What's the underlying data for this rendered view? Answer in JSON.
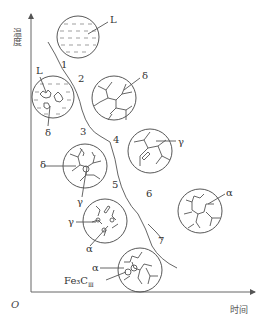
{
  "diagram": {
    "axes": {
      "y_label": "温度",
      "x_label": "时间",
      "origin": "O"
    },
    "stages": [
      "1",
      "2",
      "3",
      "4",
      "5",
      "6",
      "7"
    ],
    "phases": {
      "liquid": "L",
      "delta": "δ",
      "gamma": "γ",
      "alpha": "α",
      "cementite": "Fe₃C",
      "cementite_sub": "Ⅲ"
    },
    "circles": [
      {
        "id": "c1",
        "label": "L"
      },
      {
        "id": "c2",
        "labels": [
          "L",
          "δ"
        ]
      },
      {
        "id": "c3",
        "label": "δ"
      },
      {
        "id": "c4",
        "labels": [
          "δ",
          "γ"
        ]
      },
      {
        "id": "c5",
        "label": "γ"
      },
      {
        "id": "c6",
        "labels": [
          "γ",
          "α"
        ]
      },
      {
        "id": "c7",
        "label": "α"
      },
      {
        "id": "c8",
        "labels": [
          "α",
          "Fe₃CⅢ"
        ]
      }
    ]
  }
}
